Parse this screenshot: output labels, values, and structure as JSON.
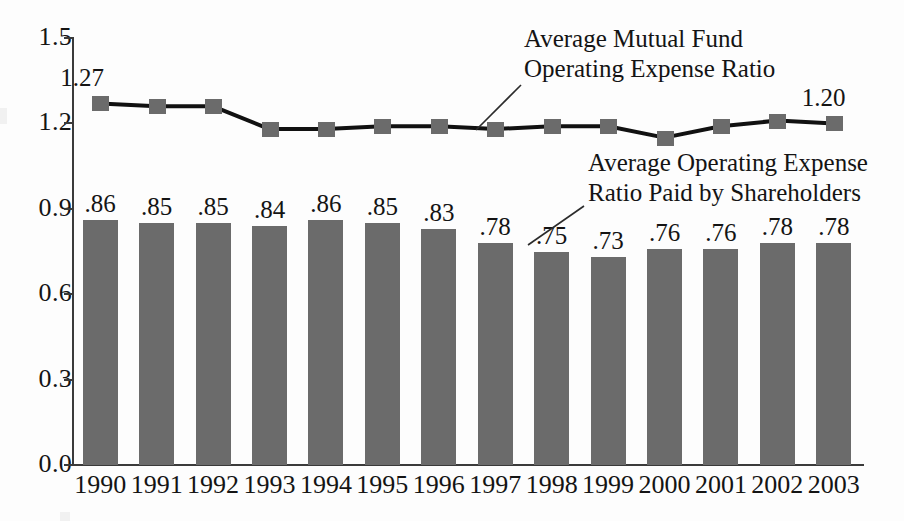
{
  "chart_data": {
    "type": "bar",
    "title": "",
    "subtitle": "",
    "xlabel": "",
    "ylabel": "",
    "ylim": [
      0.0,
      1.5
    ],
    "yticks": [
      "0.0",
      "0.3",
      "0.6",
      "0.9",
      "1.2",
      "1.5"
    ],
    "ytick_values": [
      0.0,
      0.3,
      0.6,
      0.9,
      1.2,
      1.5
    ],
    "grid": false,
    "legend_position": "inline-annotations",
    "categories": [
      "1990",
      "1991",
      "1992",
      "1993",
      "1994",
      "1995",
      "1996",
      "1997",
      "1998",
      "1999",
      "2000",
      "2001",
      "2002",
      "2003"
    ],
    "series": [
      {
        "name": "Average Operating Expense Ratio Paid by Shareholders",
        "type": "bar",
        "color": "#6b6b6b",
        "values": [
          0.86,
          0.85,
          0.85,
          0.84,
          0.86,
          0.85,
          0.83,
          0.78,
          0.75,
          0.73,
          0.76,
          0.76,
          0.78,
          0.78
        ],
        "labels": [
          ".86",
          ".85",
          ".85",
          ".84",
          ".86",
          ".85",
          ".83",
          ".78",
          ".75",
          ".73",
          ".76",
          ".76",
          ".78",
          ".78"
        ]
      },
      {
        "name": "Average Mutual Fund Operating Expense Ratio",
        "type": "line",
        "color": "#6b6b6b",
        "line_color": "#111111",
        "marker": "square",
        "values": [
          1.27,
          1.26,
          1.26,
          1.18,
          1.18,
          1.19,
          1.19,
          1.18,
          1.19,
          1.19,
          1.15,
          1.19,
          1.21,
          1.2
        ],
        "labels": {
          "first": "1.27",
          "last": "1.20"
        }
      }
    ],
    "annotations": [
      {
        "id": "line-series-annotation",
        "lines": [
          "Average Mutual Fund",
          "Operating Expense Ratio"
        ],
        "points_to": "1996"
      },
      {
        "id": "bar-series-annotation",
        "lines": [
          "Average Operating Expense",
          "Ratio Paid by Shareholders"
        ],
        "points_to": "1997"
      }
    ]
  },
  "axis": {
    "y_ticks": [
      "1.5",
      "1.2",
      "0.9",
      "0.6",
      "0.3",
      "0.0"
    ],
    "x_ticks": [
      "1990",
      "1991",
      "1992",
      "1993",
      "1994",
      "1995",
      "1996",
      "1997",
      "1998",
      "1999",
      "2000",
      "2001",
      "2002",
      "2003"
    ]
  },
  "endpoint_labels": {
    "first": "1.27",
    "last": "1.20"
  },
  "bar_labels": [
    ".86",
    ".85",
    ".85",
    ".84",
    ".86",
    ".85",
    ".83",
    ".78",
    ".75",
    ".73",
    ".76",
    ".76",
    ".78",
    ".78"
  ],
  "annotation_line": {
    "l1": "Average Mutual Fund",
    "l2": "Operating Expense Ratio"
  },
  "annotation_bar": {
    "l1": "Average Operating Expense",
    "l2": "Ratio Paid by Shareholders"
  }
}
